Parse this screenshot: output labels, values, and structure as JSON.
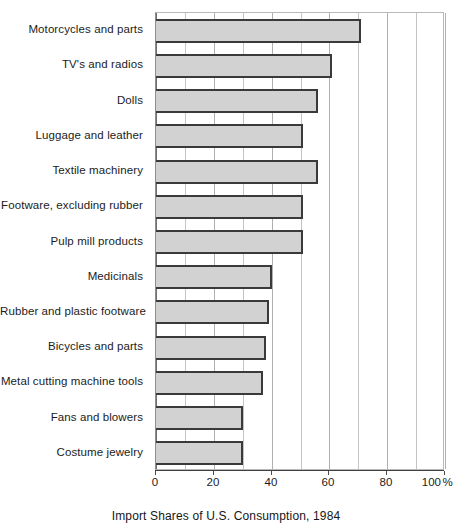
{
  "chart_data": {
    "type": "bar",
    "orientation": "horizontal",
    "title": "",
    "caption": "Import Shares of U.S. Consumption, 1984",
    "xlabel": "Import Shares of U.S. Consumption, 1984",
    "ylabel": "",
    "xlim": [
      0,
      100
    ],
    "x_unit": "%",
    "grid": true,
    "grid_axis": "x",
    "minor_tick_step": 10,
    "major_tick_step": 20,
    "legend": "none",
    "categories": [
      "Motorcycles and parts",
      "TV's and radios",
      "Dolls",
      "Luggage and leather",
      "Textile machinery",
      "Footware, excluding rubber",
      "Pulp mill products",
      "Medicinals",
      "Rubber and plastic footware",
      "Bicycles and parts",
      "Metal cutting machine tools",
      "Fans and blowers",
      "Costume jewelry"
    ],
    "values": [
      71,
      61,
      56,
      51,
      56,
      51,
      51,
      40,
      39,
      38,
      37,
      30,
      30
    ],
    "tick_values": [
      0,
      20,
      40,
      60,
      80,
      100
    ],
    "tick_labels": [
      "0",
      "20",
      "40",
      "60",
      "80",
      "100"
    ],
    "last_tick_suffix": "%",
    "minor_tick_values": [
      10,
      30,
      50,
      70,
      90
    ],
    "colors": {
      "bar_fill": "#d2d2d2",
      "bar_border": "#3a3a3a",
      "gridline": "#c4c4c4",
      "axis": "#3f3f3f",
      "text": "#1c1c1c",
      "background": "#ffffff"
    }
  }
}
